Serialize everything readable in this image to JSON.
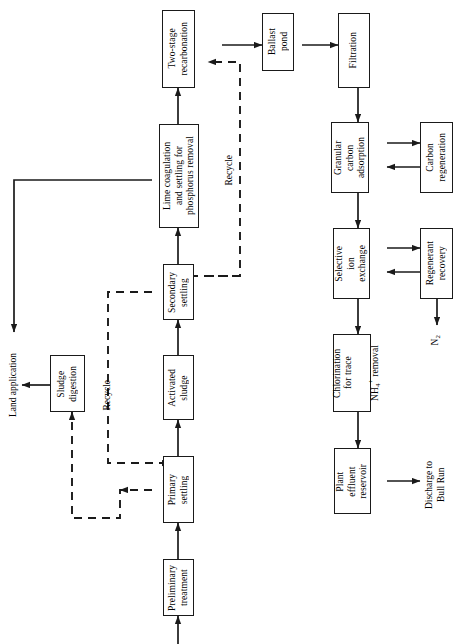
{
  "diagram": {
    "orientation": "rotated-90",
    "line_color": "#1a1a1a",
    "background": "#ffffff",
    "nodes": [
      {
        "id": "preliminary_treatment",
        "label": "Preliminary\ntreatment"
      },
      {
        "id": "primary_settling",
        "label": "Primary\nsettling"
      },
      {
        "id": "activated_sludge",
        "label": "Activated\nsludge"
      },
      {
        "id": "secondary_settling",
        "label": "Secondary\nsettling"
      },
      {
        "id": "lime_coagulation",
        "label": "Lime coagulation\nand settling for\nphosphorus removal"
      },
      {
        "id": "two_stage_recarbonation",
        "label": "Two-stage\nrecarbonation"
      },
      {
        "id": "ballast_pond",
        "label": "Ballast\npond"
      },
      {
        "id": "filtration",
        "label": "Filtration"
      },
      {
        "id": "granular_carbon_adsorption",
        "label": "Granular\ncarbon\nadsorption"
      },
      {
        "id": "carbon_regeneration",
        "label": "Carbon\nregeneration"
      },
      {
        "id": "selective_ion_exchange",
        "label": "Selective\nion\nexchange"
      },
      {
        "id": "regenerant_recovery",
        "label": "Regenerant\nrecovery"
      },
      {
        "id": "chlorination",
        "label": "Chlorination\nfor trace"
      },
      {
        "id": "chlorination_formula_prefix",
        "label": "NH"
      },
      {
        "id": "chlorination_formula_sub",
        "label": "4"
      },
      {
        "id": "chlorination_formula_sup",
        "label": "+"
      },
      {
        "id": "chlorination_formula_suffix",
        "label": " removal"
      },
      {
        "id": "sludge_digestion",
        "label": "Sludge\ndigestion"
      },
      {
        "id": "plant_effluent_reservoir",
        "label": "Plant\neffluent\nreservoir"
      }
    ],
    "free_labels": [
      {
        "id": "land_application",
        "label": "Land application"
      },
      {
        "id": "discharge_bull_run",
        "label": "Discharge to\nBull Run"
      },
      {
        "id": "nitrogen_gas_prefix",
        "label": "N"
      },
      {
        "id": "nitrogen_gas_sub",
        "label": "2"
      },
      {
        "id": "recycle_upper",
        "label": "Recycle"
      },
      {
        "id": "recycle_lower",
        "label": "Recycle"
      }
    ],
    "edges": [
      {
        "from": "inlet",
        "to": "preliminary_treatment",
        "style": "solid"
      },
      {
        "from": "preliminary_treatment",
        "to": "primary_settling",
        "style": "solid"
      },
      {
        "from": "primary_settling",
        "to": "activated_sludge",
        "style": "solid"
      },
      {
        "from": "activated_sludge",
        "to": "secondary_settling",
        "style": "solid"
      },
      {
        "from": "secondary_settling",
        "to": "lime_coagulation",
        "style": "solid"
      },
      {
        "from": "lime_coagulation",
        "to": "two_stage_recarbonation",
        "style": "solid"
      },
      {
        "from": "lime_coagulation",
        "to": "land_application",
        "style": "solid"
      },
      {
        "from": "two_stage_recarbonation",
        "to": "ballast_pond",
        "style": "solid"
      },
      {
        "from": "ballast_pond",
        "to": "filtration",
        "style": "solid"
      },
      {
        "from": "filtration",
        "to": "granular_carbon_adsorption",
        "style": "solid"
      },
      {
        "from": "granular_carbon_adsorption",
        "to": "carbon_regeneration",
        "style": "solid"
      },
      {
        "from": "carbon_regeneration",
        "to": "granular_carbon_adsorption",
        "style": "solid"
      },
      {
        "from": "granular_carbon_adsorption",
        "to": "selective_ion_exchange",
        "style": "solid"
      },
      {
        "from": "selective_ion_exchange",
        "to": "regenerant_recovery",
        "style": "solid"
      },
      {
        "from": "regenerant_recovery",
        "to": "selective_ion_exchange",
        "style": "solid"
      },
      {
        "from": "regenerant_recovery",
        "to": "nitrogen_gas",
        "style": "solid"
      },
      {
        "from": "selective_ion_exchange",
        "to": "chlorination",
        "style": "solid"
      },
      {
        "from": "chlorination",
        "to": "plant_effluent_reservoir",
        "style": "solid"
      },
      {
        "from": "plant_effluent_reservoir",
        "to": "discharge_bull_run",
        "style": "solid"
      },
      {
        "from": "sludge_digestion",
        "to": "land_application",
        "style": "solid"
      },
      {
        "from": "secondary_settling",
        "to": "activated_sludge",
        "style": "dashed",
        "label": "Recycle"
      },
      {
        "from": "primary_settling",
        "to": "sludge_digestion",
        "style": "dashed"
      },
      {
        "from": "lime_coagulation",
        "to": "secondary_settling",
        "style": "dashed",
        "label": "Recycle"
      },
      {
        "from": "recycle_line",
        "to": "two_stage_recarbonation",
        "style": "dashed"
      }
    ]
  }
}
